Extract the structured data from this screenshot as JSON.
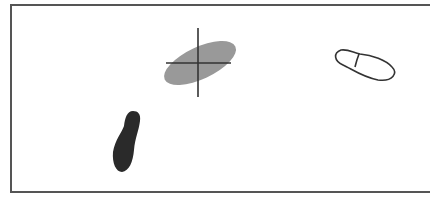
{
  "diagram": {
    "frame": {
      "border_color": "#555555",
      "background": "#ffffff"
    },
    "shapes": [
      {
        "id": "gray-ellipse",
        "kind": "ellipse",
        "fill": "#999999",
        "cx": 200,
        "cy": 63,
        "rx": 38,
        "ry": 17,
        "rotate": -25
      },
      {
        "id": "crosshair",
        "kind": "crosshair",
        "stroke": "#333333",
        "cx": 198,
        "cy": 63,
        "h_len": 64,
        "v_top": 28,
        "v_bottom": 98
      },
      {
        "id": "outline-footprint",
        "kind": "footprint-outline",
        "stroke": "#333333",
        "fill": "#ffffff"
      },
      {
        "id": "dark-footprint",
        "kind": "footprint-filled",
        "fill": "#2a2a2a"
      }
    ]
  }
}
